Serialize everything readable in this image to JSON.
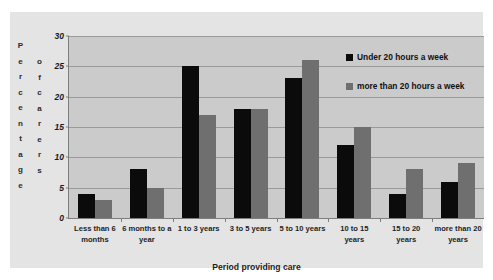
{
  "chart_data": {
    "type": "bar",
    "title": "",
    "xlabel": "Period providing care",
    "ylabel": "Percentage of carers",
    "ylabel_columns": [
      "Percentage",
      "of carers"
    ],
    "ylim": [
      0,
      30
    ],
    "yticks": [
      0,
      5,
      10,
      15,
      20,
      25,
      30
    ],
    "grid": true,
    "legend_position": "top-right",
    "categories": [
      "Less than 6 months",
      "6 months to a year",
      "1 to 3 years",
      "3 to 5 years",
      "5 to 10 years",
      "10 to 15 years",
      "15 to 20 years",
      "more than 20 years"
    ],
    "series": [
      {
        "name": "Under 20 hours a week",
        "color": "#0b0b0b",
        "values": [
          4,
          8,
          25,
          18,
          23,
          12,
          4,
          6
        ]
      },
      {
        "name": "more than 20 hours a week",
        "color": "#6f6f6f",
        "values": [
          3,
          5,
          17,
          18,
          26,
          15,
          8,
          9
        ]
      }
    ]
  },
  "colors": {
    "figure_background": "#ffffff",
    "panel_background": "#e4e4e4",
    "plot_background": "#cbcbcb",
    "gridline": "#9a9a9a",
    "axis_line": "#7d7d7d",
    "text": "#1f1f1f"
  }
}
